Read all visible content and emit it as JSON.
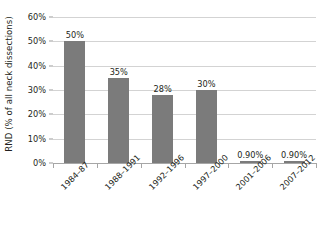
{
  "chart_data": {
    "type": "bar",
    "title": "",
    "xlabel": "",
    "ylabel": "RND (% of all neck dissections)",
    "categories": [
      "1984–87",
      "1988–1991",
      "1992–1996",
      "1997–2000",
      "2001–2006",
      "2007–2012"
    ],
    "values": [
      50,
      35,
      28,
      30,
      0.9,
      0.9
    ],
    "value_labels": [
      "50%",
      "35%",
      "28%",
      "30%",
      "0.90%",
      "0.90%"
    ],
    "ylim": [
      0,
      60
    ],
    "ytick_values": [
      0,
      10,
      20,
      30,
      40,
      50,
      60
    ],
    "ytick_labels": [
      "0%",
      "10%",
      "20%",
      "30%",
      "40%",
      "50%",
      "60%"
    ],
    "grid": "horizontal",
    "legend": "none",
    "series": [
      {
        "name": "RND",
        "values": [
          50,
          35,
          28,
          30,
          0.9,
          0.9
        ]
      }
    ],
    "colors": {
      "bar": "#7b7b7b",
      "gridline": "#d3d3d3",
      "axis": "#a6a6a6",
      "text": "#231f20",
      "background": "#ffffff"
    }
  }
}
